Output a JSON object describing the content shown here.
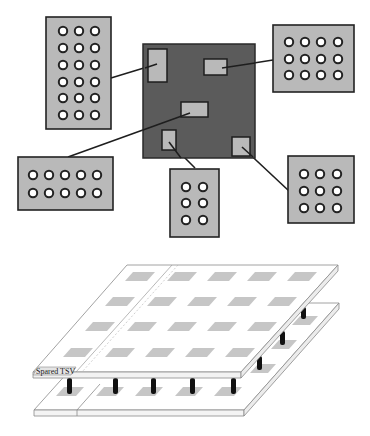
{
  "diagram": {
    "top": {
      "die": {
        "label": "chip-die",
        "color": "#5b5b5b"
      },
      "pad_color": "#b9b9b9",
      "regions": [
        {
          "name": "tsv-region-top-left",
          "cols": 3,
          "rows": 6
        },
        {
          "name": "tsv-region-top-right",
          "cols": 4,
          "rows": 3
        },
        {
          "name": "tsv-region-left",
          "cols": 5,
          "rows": 2
        },
        {
          "name": "tsv-region-bottom-center",
          "cols": 2,
          "rows": 3
        },
        {
          "name": "tsv-region-right",
          "cols": 3,
          "rows": 3
        }
      ]
    },
    "bottom": {
      "label": "Spared TSV",
      "upper_layer_pads": {
        "rows": 4,
        "cols": 5
      },
      "tsv_count_front_row": 5,
      "tsv_count_side_column": 3
    }
  }
}
